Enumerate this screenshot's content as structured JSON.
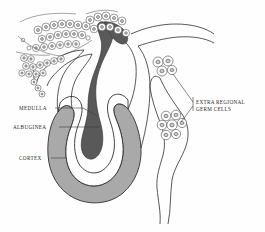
{
  "figure": {
    "background_color": "#fefefe",
    "line_color": "#2f2f2f"
  },
  "colors": {
    "medulla_fill": "#595959",
    "cortex_fill": "#a9a9a9",
    "albuginea_fill": "#ffffff",
    "outline": "#2f2f2f",
    "cell_outline": "#4a4a4a",
    "nucleus_fill": "#c9c9c9",
    "leader_line": "#3a3a3a",
    "text": "#2b2b2b"
  },
  "labels": {
    "medulla": {
      "text": "MEDULLA",
      "x": 19,
      "y": 110,
      "anchor": "start",
      "leader": "M 55 108 L 83 108 L 97 116"
    },
    "albuginea": {
      "text": "ALBUGINEA",
      "x": 13,
      "y": 129,
      "anchor": "start",
      "leader": "M 59 127 L 100 127"
    },
    "cortex": {
      "text": "CORTEX",
      "x": 19,
      "y": 160,
      "anchor": "start",
      "leader": "M 51 158 L 66 158"
    },
    "extra_regional_germ_cells": {
      "line1": "EXTRA REGIONAL",
      "line2": "GERM CELLS",
      "x": 196,
      "y": 104,
      "y2": 111,
      "anchor": "start",
      "leader_upper": "M 193 102 L 173 74",
      "leader_lower": "M 193 106 L 181 122",
      "leader_spine": "M 193 96 L 193 112"
    }
  },
  "structures": {
    "medulla": {
      "name": "medulla",
      "description": "dark gray U-shaped inner band descending into gonad"
    },
    "cortex": {
      "name": "cortex",
      "description": "light gray outer U-shaped mass of the gonad"
    },
    "albuginea": {
      "name": "tunica-albuginea",
      "description": "white layer separating medulla from cortex"
    },
    "mesonephros": {
      "name": "mesonephros",
      "description": "upper-left tissue with chains of round cells"
    },
    "mesonephric_duct": {
      "name": "mesonephric-duct",
      "description": "wavy tapering tail descending at right"
    }
  },
  "germ_cell_clusters": [
    {
      "name": "upper-extra-regional-cluster",
      "cx": 163,
      "cy": 66,
      "cell_count": 4
    },
    {
      "name": "lower-extra-regional-cluster",
      "cx": 172,
      "cy": 126,
      "cell_count": 7
    }
  ],
  "mesonephros_cells": {
    "count": 58,
    "description": "chains of small round nucleated cells in upper left region"
  }
}
